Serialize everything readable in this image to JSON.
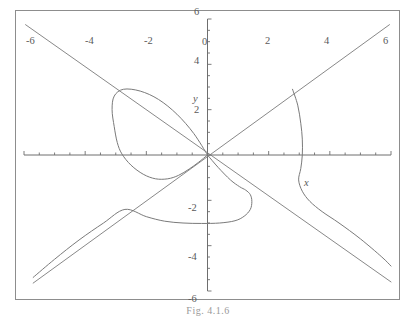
{
  "figure": {
    "caption": "Fig. 4.1.6",
    "axis_labels": {
      "x": "x",
      "y": "y"
    },
    "frame_color": "#8d8d8d",
    "curve_color": "#7a7a7a",
    "axis_color": "#6e6e6e",
    "label_color": "#5a5a5a"
  },
  "chart_data": {
    "type": "line",
    "title": "Fig. 4.1.6",
    "xlabel": "x",
    "ylabel": "y",
    "grid": false,
    "legend": false,
    "xlim": [
      -6,
      6
    ],
    "ylim": [
      -6,
      6
    ],
    "xticks": [
      -6,
      -4,
      -2,
      0,
      2,
      4,
      6
    ],
    "xtick_labels": [
      "-6",
      "-4",
      "-2",
      "0",
      "2",
      "4",
      "6"
    ],
    "yticks": [
      -6,
      -4,
      -2,
      2,
      4,
      6
    ],
    "ytick_labels": [
      "-6",
      "-4",
      "-2",
      "2",
      "4",
      "6"
    ],
    "minor_tick_step": 0.5,
    "series": [
      {
        "name": "folium-loop",
        "kind": "closed-loop",
        "comment": "Loop of the folium passing through the origin, bulging up and to the left, top near y=3 at x=-0.6, leftmost near x=-2.95 at y=0.1, bottom of loop near y=-1.1 at x=-1.7",
        "points": [
          [
            0,
            0
          ],
          [
            -0.45,
            0.95
          ],
          [
            -1.0,
            1.8
          ],
          [
            -1.6,
            2.45
          ],
          [
            -2.2,
            2.82
          ],
          [
            -2.75,
            2.9
          ],
          [
            -3.05,
            2.6
          ],
          [
            -3.12,
            2.0
          ],
          [
            -3.05,
            1.25
          ],
          [
            -2.95,
            0.55
          ],
          [
            -2.8,
            0.05
          ],
          [
            -2.5,
            -0.45
          ],
          [
            -2.1,
            -0.85
          ],
          [
            -1.7,
            -1.05
          ],
          [
            -1.3,
            -1.05
          ],
          [
            -0.95,
            -0.9
          ],
          [
            -0.6,
            -0.62
          ],
          [
            -0.3,
            -0.33
          ],
          [
            0,
            0
          ]
        ]
      },
      {
        "name": "lower-branch",
        "kind": "open-branch",
        "comment": "Branch entering from origin region, dipping to a minimum near y=-3 around x=0.4 then rising to an inflection near (1.3,-1.55), falling again and sweeping left to the bottom-left corner",
        "points": [
          [
            0,
            0
          ],
          [
            0.35,
            -0.55
          ],
          [
            0.75,
            -1.1
          ],
          [
            1.05,
            -1.4
          ],
          [
            1.25,
            -1.55
          ],
          [
            1.4,
            -1.75
          ],
          [
            1.45,
            -2.05
          ],
          [
            1.4,
            -2.4
          ],
          [
            1.2,
            -2.7
          ],
          [
            0.9,
            -2.9
          ],
          [
            0.4,
            -3.0
          ],
          [
            -0.2,
            -3.02
          ],
          [
            -0.8,
            -3.0
          ],
          [
            -1.4,
            -2.92
          ],
          [
            -2.0,
            -2.72
          ],
          [
            -2.7,
            -2.4
          ],
          [
            -3.4,
            -3.0
          ],
          [
            -4.2,
            -3.75
          ],
          [
            -5.0,
            -4.6
          ],
          [
            -5.7,
            -5.4
          ]
        ]
      },
      {
        "name": "right-branch",
        "kind": "open-branch",
        "comment": "Branch coming down from top near x=2.9, crossing x-axis near x=3.1, then sweeping right and down toward the lower-right corner",
        "points": [
          [
            2.78,
            2.9
          ],
          [
            2.95,
            2.2
          ],
          [
            3.05,
            1.4
          ],
          [
            3.1,
            0.7
          ],
          [
            3.1,
            0.0
          ],
          [
            3.05,
            -0.6
          ],
          [
            2.98,
            -1.1
          ],
          [
            3.1,
            -1.6
          ],
          [
            3.35,
            -2.05
          ],
          [
            3.75,
            -2.5
          ],
          [
            4.3,
            -3.0
          ],
          [
            5.0,
            -3.7
          ],
          [
            5.7,
            -4.5
          ],
          [
            6.0,
            -4.9
          ]
        ]
      },
      {
        "name": "asymptote-descending",
        "kind": "line",
        "comment": "Straight line of negative slope from upper-left to lower-right through the origin",
        "points": [
          [
            -5.95,
            5.75
          ],
          [
            6.0,
            -5.6
          ]
        ]
      },
      {
        "name": "asymptote-ascending",
        "kind": "line",
        "comment": "Straight line of positive slope from lower-left to upper-right through the origin",
        "points": [
          [
            -5.7,
            -5.65
          ],
          [
            5.95,
            5.75
          ]
        ]
      }
    ]
  }
}
